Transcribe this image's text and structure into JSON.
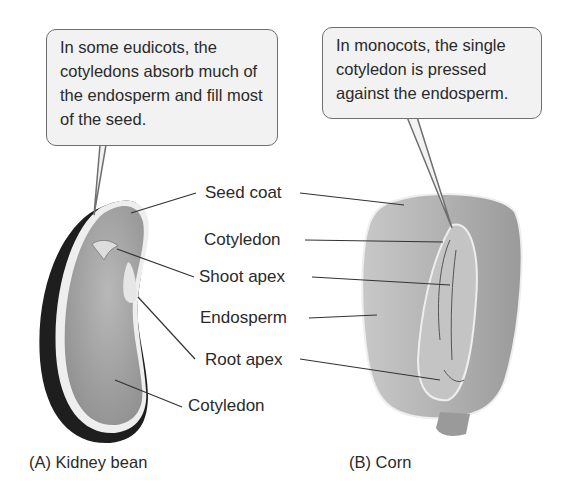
{
  "callouts": {
    "eudicot": "In some eudicots, the cotyledons absorb much of the endosperm and fill most of the seed.",
    "monocot": "In monocots, the single cotyledon is pressed against the endosperm."
  },
  "labels": {
    "seed_coat": "Seed coat",
    "cotyledon_top": "Cotyledon",
    "shoot_apex": "Shoot apex",
    "endosperm": "Endosperm",
    "root_apex": "Root apex",
    "cotyledon_bottom": "Cotyledon"
  },
  "captions": {
    "a": "(A)  Kidney bean",
    "b": "(B)  Corn"
  },
  "colors": {
    "callout_fill": "#f2f2f2",
    "callout_border": "#6f6f6f",
    "seed_fill": "#a9a9a9",
    "seed_coat_dark": "#1e1e1e",
    "text": "#2a2a2a"
  }
}
